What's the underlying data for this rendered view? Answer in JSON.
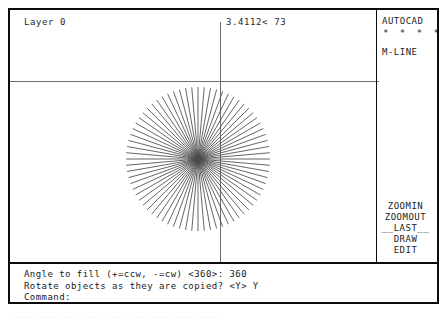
{
  "app": {
    "name": "AUTOCAD",
    "screen_title": "AutoCAD drawing editor screen"
  },
  "status": {
    "layer_label": "Layer 0",
    "coordinate_display": "3.4112< 73"
  },
  "side_menu": {
    "header": "AUTOCAD",
    "dots": "* * * *",
    "current_command": "M-LINE",
    "items": [
      {
        "label": "ZOOMIN",
        "name": "menu-item-zoomin"
      },
      {
        "label": "ZOOMOUT",
        "name": "menu-item-zoomout"
      },
      {
        "label": "__LAST__",
        "name": "menu-item-last"
      },
      {
        "label": "DRAW",
        "name": "menu-item-draw"
      },
      {
        "label": "EDIT",
        "name": "menu-item-edit"
      }
    ]
  },
  "command_area": {
    "lines": [
      "Angle to fill (+=ccw, -=cw) <360>: 360",
      "Rotate objects as they are copied? <Y> Y",
      "Command:"
    ],
    "prompt_line_1": "Angle to fill (+=ccw, -=cw) <360>: 360",
    "prompt_line_2": "Rotate objects as they are copied? <Y> Y",
    "prompt_line_3": "Command:"
  },
  "drawing": {
    "object_type": "polar-array-radial-burst",
    "center_x": 188,
    "center_y": 149,
    "radius": 72,
    "line_count": 72,
    "angle_step_degrees": 5,
    "stroke_color": "#4a4a4a"
  },
  "crosshair": {
    "x": 210,
    "y": 71,
    "color": "#6e6e6e"
  },
  "colors": {
    "background": "#ffffff",
    "foreground": "#1a1a1a",
    "frame": "#0c0c0c",
    "geometry": "#4a4a4a",
    "crosshair": "#6e6e6e"
  },
  "caption_artifact": "............................................"
}
